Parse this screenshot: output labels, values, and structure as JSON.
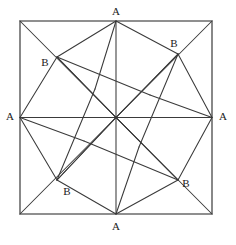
{
  "figure": {
    "name": "eight-pointed-pinwheel-star-in-square",
    "background_color": "#ffffff",
    "square_stroke_color": "#6b6b6b",
    "line_stroke_color": "#3a3a3a",
    "label_color": "#1a1a1a",
    "square": {
      "left": 20,
      "top": 21,
      "right": 212,
      "bottom": 214
    },
    "center": {
      "x": 116,
      "y": 117.5
    },
    "vertices": {
      "A_top": {
        "x": 116,
        "y": 21,
        "label": "A",
        "label_x": 116,
        "label_y": 12
      },
      "A_right": {
        "x": 212,
        "y": 117.5,
        "label": "A",
        "label_x": 223,
        "label_y": 117
      },
      "A_bottom": {
        "x": 116,
        "y": 214,
        "label": "A",
        "label_x": 116,
        "label_y": 227
      },
      "A_left": {
        "x": 20,
        "y": 117.5,
        "label": "A",
        "label_x": 10,
        "label_y": 117
      },
      "B_topleft": {
        "x": 57,
        "y": 57,
        "label": "B",
        "label_x": 45,
        "label_y": 63
      },
      "B_topright": {
        "x": 178,
        "y": 54,
        "label": "B",
        "label_x": 174,
        "label_y": 44
      },
      "B_bottomright": {
        "x": 178,
        "y": 180,
        "label": "B",
        "label_x": 186,
        "label_y": 184
      },
      "B_bottomleft": {
        "x": 57,
        "y": 180,
        "label": "B",
        "label_x": 67,
        "label_y": 192
      }
    },
    "labels": [
      {
        "text": "A",
        "x": 116,
        "y": 12,
        "name": "vertex-label-a-top"
      },
      {
        "text": "A",
        "x": 223,
        "y": 117,
        "name": "vertex-label-a-right"
      },
      {
        "text": "A",
        "x": 116,
        "y": 227,
        "name": "vertex-label-a-bottom"
      },
      {
        "text": "A",
        "x": 10,
        "y": 117,
        "name": "vertex-label-a-left"
      },
      {
        "text": "B",
        "x": 45,
        "y": 63,
        "name": "vertex-label-b-topleft"
      },
      {
        "text": "B",
        "x": 174,
        "y": 44,
        "name": "vertex-label-b-topright"
      },
      {
        "text": "B",
        "x": 186,
        "y": 184,
        "name": "vertex-label-b-bottomright"
      },
      {
        "text": "B",
        "x": 67,
        "y": 192,
        "name": "vertex-label-b-bottomleft"
      }
    ],
    "square_path": "M 20 21 L 212 21 L 212 214 L 20 214 Z",
    "axis_paths": [
      "M 116 21 L 116 214",
      "M 20 117.5 L 212 117.5"
    ],
    "diagonal_paths": [
      "M 20 21 L 212 214",
      "M 212 21 L 20 214"
    ],
    "star_paths": [
      "M 116 21 L 57 57",
      "M 57 57 L 116 117.5",
      "M 116 117.5 L 178 54",
      "M 178 54 L 116 21",
      "M 212 117.5 L 178 54",
      "M 178 54 L 116 117.5",
      "M 116 117.5 L 178 180",
      "M 178 180 L 212 117.5",
      "M 116 214 L 178 180",
      "M 178 180 L 116 117.5",
      "M 116 117.5 L 57 180",
      "M 57 180 L 116 214",
      "M 20 117.5 L 57 180",
      "M 57 180 L 116 117.5",
      "M 116 117.5 L 57 57",
      "M 57 57 L 20 117.5",
      "M 57 57 L 150 95",
      "M 178 54 L 139 147",
      "M 178 180 L 84 141",
      "M 57 180 L 95 89",
      "M 116 21 L 95 89",
      "M 212 117.5 L 150 95",
      "M 116 214 L 139 147",
      "M 20 117.5 L 84 141"
    ]
  }
}
